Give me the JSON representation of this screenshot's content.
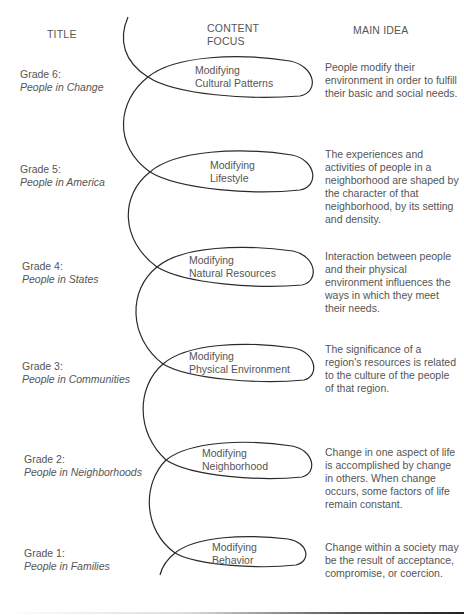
{
  "headers": {
    "title": "TITLE",
    "content_focus_line1": "CONTENT",
    "content_focus_line2": "FOCUS",
    "main_idea": "MAIN IDEA"
  },
  "rows": [
    {
      "grade": "Grade 6:",
      "book": "People in Change",
      "focus_line1": "Modifying",
      "focus_line2": "Cultural Patterns",
      "idea": "People modify their environment in order to fulfill their basic and social needs."
    },
    {
      "grade": "Grade 5:",
      "book": "People in America",
      "focus_line1": "Modifying",
      "focus_line2": "Lifestyle",
      "idea": "The experiences and activities of people in a neighborhood are shaped by the character of that neighborhood, by its setting and density."
    },
    {
      "grade": "Grade 4:",
      "book": "People in States",
      "focus_line1": "Modifying",
      "focus_line2": "Natural Resources",
      "idea": "Interaction between people and their physical environment influences the ways in which they meet their needs."
    },
    {
      "grade": "Grade 3:",
      "book": "People in Communities",
      "focus_line1": "Modifying",
      "focus_line2": "Physical Environment",
      "idea": "The significance of a region's resources is related to the culture of the people of that region."
    },
    {
      "grade": "Grade 2:",
      "book": "People in Neighborhoods",
      "focus_line1": "Modifying",
      "focus_line2": "Neighborhood",
      "idea": "Change in one aspect of life is accomplished by change in others. When change occurs, some factors of life remain constant."
    },
    {
      "grade": "Grade 1:",
      "book": "People in Families",
      "focus_line1": "Modifying",
      "focus_line2": "Behavior",
      "idea": "Change within a society may be the result of acceptance, compromise, or coercion."
    }
  ],
  "colors": {
    "line": "#2a2a2a",
    "text": "#555555",
    "background": "#ffffff"
  }
}
